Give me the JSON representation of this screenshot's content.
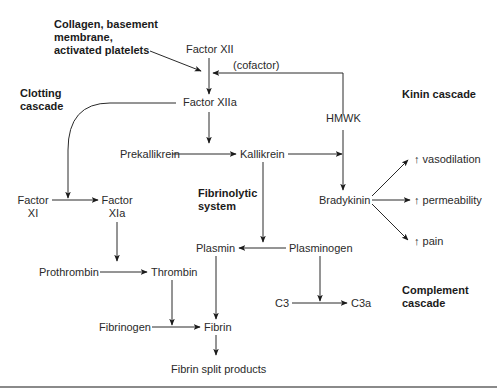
{
  "diagram": {
    "section_headers": {
      "triggers": "Collagen, basement\nmembrane,\nactivated platelets",
      "clotting": "Clotting\ncascade",
      "kinin": "Kinin cascade",
      "fibrinolytic": "Fibrinolytic\nsystem",
      "complement": "Complement\ncascade"
    },
    "nodes": {
      "factor_xii": "Factor XII",
      "cofactor": "(cofactor)",
      "factor_xiia": "Factor XIIa",
      "hmwk": "HMWK",
      "prekallikrein": "Prekallikrein",
      "kallikrein": "Kallikrein",
      "bradykinin": "Bradykinin",
      "vasodilation": "↑ vasodilation",
      "permeability": "↑ permeability",
      "pain": "↑ pain",
      "factor_xi_1": "Factor",
      "factor_xi_2": "XI",
      "factor_xia_1": "Factor",
      "factor_xia_2": "XIa",
      "prothrombin": "Prothrombin",
      "thrombin": "Thrombin",
      "fibrinogen": "Fibrinogen",
      "fibrin": "Fibrin",
      "fibrin_split": "Fibrin split products",
      "plasmin": "Plasmin",
      "plasminogen": "Plasminogen",
      "c3": "C3",
      "c3a": "C3a"
    },
    "colors": {
      "line": "#2a2a2a",
      "text": "#2a2a2a",
      "rule": "#8a8a8a"
    }
  }
}
